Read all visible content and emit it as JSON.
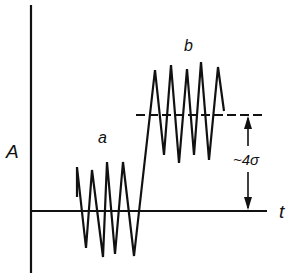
{
  "diagram": {
    "axis_label_y": "A",
    "axis_label_x": "t",
    "signal_a_label": "a",
    "signal_b_label": "b",
    "step_label": "~4σ",
    "stroke_color": "#111111",
    "background": "#ffffff",
    "signal_a_points": "77,197 77,167 86,248 92,170 103,257 107,162 115,254 123,162 134,256 155,70",
    "signal_b_points": "155,70 164,155 171,65 179,163 187,69 194,155 201,62 209,160 218,67 224,111"
  }
}
